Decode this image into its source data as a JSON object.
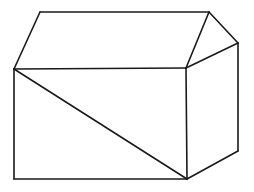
{
  "diagram": {
    "title": "",
    "stroke_color": "#1a1a1a",
    "background": "#ffffff",
    "stroke_width": 1.6,
    "lines": [
      {
        "name": "roof-top-edge",
        "x1": 40,
        "y1": 12,
        "x2": 209,
        "y2": 12
      },
      {
        "name": "roof-left-edge",
        "x1": 40,
        "y1": 12,
        "x2": 14,
        "y2": 69
      },
      {
        "name": "roof-front-slope",
        "x1": 209,
        "y1": 12,
        "x2": 186,
        "y2": 68
      },
      {
        "name": "roof-back-slope",
        "x1": 209,
        "y1": 12,
        "x2": 238,
        "y2": 43
      },
      {
        "name": "gable-base-edge",
        "x1": 186,
        "y1": 68,
        "x2": 238,
        "y2": 43
      },
      {
        "name": "front-top-edge",
        "x1": 14,
        "y1": 69,
        "x2": 186,
        "y2": 68
      },
      {
        "name": "front-left-edge",
        "x1": 14,
        "y1": 69,
        "x2": 14,
        "y2": 179
      },
      {
        "name": "front-bottom-edge",
        "x1": 14,
        "y1": 179,
        "x2": 187,
        "y2": 179
      },
      {
        "name": "front-right-edge",
        "x1": 186,
        "y1": 68,
        "x2": 187,
        "y2": 179
      },
      {
        "name": "front-diagonal",
        "x1": 14,
        "y1": 69,
        "x2": 187,
        "y2": 179
      },
      {
        "name": "side-right-edge",
        "x1": 238,
        "y1": 43,
        "x2": 238,
        "y2": 151
      },
      {
        "name": "side-bottom-edge",
        "x1": 187,
        "y1": 179,
        "x2": 238,
        "y2": 151
      }
    ]
  }
}
